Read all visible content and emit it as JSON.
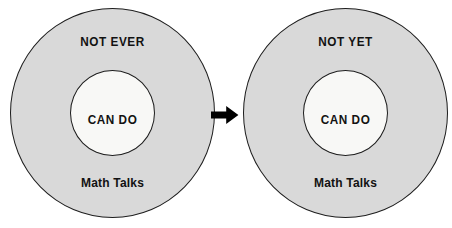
{
  "figure": {
    "type": "concentric-circle-diagram-pair",
    "background_color": "#ffffff",
    "outer_fill_color": "#d9d9d9",
    "inner_fill_color": "#f8f8f6",
    "outline_color": "#1d1d1d",
    "text_color": "#121212",
    "arrow_color": "#000000"
  },
  "diagrams": [
    {
      "id": "before",
      "outer_top_label": "NOT EVER",
      "inner_label": "CAN DO",
      "outer_bottom_label": "Math Talks"
    },
    {
      "id": "after",
      "outer_top_label": "NOT YET",
      "inner_label": "CAN DO",
      "outer_bottom_label": "Math Talks"
    }
  ],
  "arrow": {
    "icon": "arrow-right-icon",
    "direction": "right"
  }
}
